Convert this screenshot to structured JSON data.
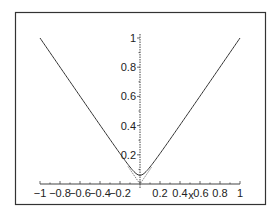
{
  "chart_data": {
    "type": "line",
    "title": "",
    "xlabel": "x",
    "ylabel": "",
    "xlim": [
      -1,
      1
    ],
    "ylim": [
      0,
      1.05
    ],
    "grid": false,
    "legend": null,
    "x_ticks": [
      -1,
      -0.8,
      -0.6,
      -0.4,
      -0.2,
      0.2,
      0.4,
      0.6,
      0.8,
      1
    ],
    "x_tick_labels": [
      "-1",
      "-0.8",
      "-0.6",
      "-0.4",
      "-0.2",
      "0.2",
      "0.4",
      "0.6",
      "0.8",
      "1"
    ],
    "y_ticks": [
      0.2,
      0.4,
      0.6,
      0.8,
      1
    ],
    "y_tick_labels": [
      "0.2",
      "0.4",
      "0.6",
      "0.8",
      "1"
    ],
    "series": [
      {
        "name": "smooth approximation",
        "style": "solid",
        "x": [
          -1,
          -0.8,
          -0.6,
          -0.4,
          -0.2,
          -0.1,
          -0.05,
          0,
          0.05,
          0.1,
          0.2,
          0.4,
          0.6,
          0.8,
          1
        ],
        "values": [
          1.0,
          0.8,
          0.6,
          0.4,
          0.21,
          0.12,
          0.08,
          0.06,
          0.08,
          0.12,
          0.21,
          0.4,
          0.6,
          0.8,
          1.0
        ]
      },
      {
        "name": "|x|",
        "style": "dotted",
        "x": [
          -1,
          -0.5,
          0,
          0.5,
          1
        ],
        "values": [
          1,
          0.5,
          0,
          0.5,
          1
        ]
      }
    ],
    "colors": {
      "line": "#333333",
      "axis": "#444444",
      "frame": "#333333"
    }
  }
}
